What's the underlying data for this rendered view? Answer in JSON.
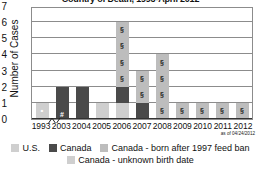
{
  "chart_data": {
    "type": "bar",
    "title": "Country of Death, 1993-April 2012",
    "xlabel": "",
    "ylabel": "Number of Cases",
    "ylim": [
      0,
      7
    ],
    "yticks": [
      "0",
      "1",
      "2",
      "3",
      "4",
      "5",
      "6",
      "7"
    ],
    "categories": [
      "1993",
      "2003",
      "2004",
      "2005",
      "2006",
      "2007",
      "2008",
      "2009",
      "2010",
      "2011",
      "2012"
    ],
    "stacked": true,
    "grid": true,
    "legend_position": "bottom",
    "note": "as of 04/24/2012",
    "axis_break_between": [
      "1993",
      "2003"
    ],
    "series": [
      {
        "name": "U.S.",
        "color": "#cfcfcf",
        "values": [
          1,
          0,
          0,
          1,
          1,
          0,
          0,
          0,
          0,
          0,
          0
        ]
      },
      {
        "name": "Canada",
        "color": "#4a4a4a",
        "values": [
          0,
          2,
          2,
          0,
          1,
          1,
          0,
          0,
          0,
          0,
          0
        ]
      },
      {
        "name": "Canada - born after 1997 feed ban",
        "color": "#bdbdbd",
        "values": [
          0,
          0,
          0,
          0,
          4,
          2,
          4,
          1,
          1,
          1,
          1
        ]
      },
      {
        "name": "Canada - unknown birth date",
        "color": "#cfcfcf",
        "values": [
          0,
          0,
          0,
          0,
          0,
          0,
          0,
          0,
          0,
          0,
          0
        ]
      }
    ],
    "segment_marks": {
      "1993": "•",
      "2003": "#",
      "section_symbol": "§"
    },
    "totals": [
      1,
      2,
      2,
      1,
      6,
      3,
      4,
      1,
      1,
      1,
      1
    ]
  },
  "legend": {
    "rows": [
      [
        {
          "label": "U.S.",
          "color": "#cfcfcf"
        },
        {
          "label": "Canada",
          "color": "#4a4a4a"
        },
        {
          "label": "Canada - born after 1997 feed ban",
          "color": "#bdbdbd"
        }
      ],
      [
        {
          "label": "Canada - unknown birth date",
          "color": "#cfcfcf"
        }
      ]
    ]
  }
}
